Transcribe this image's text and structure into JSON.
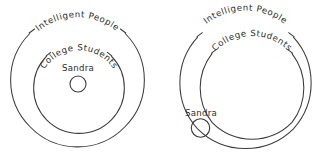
{
  "figure": {
    "background_color": "#ffffff",
    "stroke_color": "#3b3b3b",
    "text_color": "#2b2b2b"
  },
  "diagrams": [
    {
      "id": "left-diagram",
      "name": "sandra-inside-college-students",
      "description": "Sandra inside College Students inside Intelligent People",
      "outer_label": "Intelligent People",
      "middle_label": "College Students",
      "inner_label": "Sandra",
      "sandra_position": "inside-middle-circle",
      "circles": [
        {
          "name": "intelligent-people-circle",
          "cx": 77.5,
          "cy": 80,
          "r": 66
        },
        {
          "name": "college-students-circle",
          "cx": 79,
          "cy": 88,
          "r": 45.5
        },
        {
          "name": "sandra-circle",
          "cx": 78,
          "cy": 84,
          "r": 8
        }
      ]
    },
    {
      "id": "right-diagram",
      "name": "sandra-outside-college-students",
      "description": "Sandra inside Intelligent People but outside College Students",
      "outer_label": "Intelligent People",
      "middle_label": "College Students",
      "inner_label": "Sandra",
      "sandra_position": "outside-middle-circle",
      "circles": [
        {
          "name": "intelligent-people-circle",
          "cx": 245.5,
          "cy": 83,
          "r": 68
        },
        {
          "name": "college-students-circle",
          "cx": 252,
          "cy": 88,
          "r": 56
        },
        {
          "name": "sandra-circle",
          "cx": 200.5,
          "cy": 128,
          "r": 9.2
        }
      ]
    }
  ]
}
